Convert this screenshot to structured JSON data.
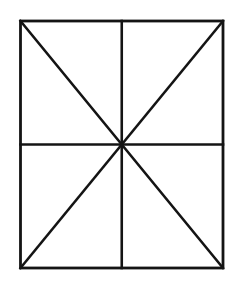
{
  "figure": {
    "title": "Rectangle divided by midlines and diagonals",
    "background_color": "#ffffff",
    "stroke_color": "#141414",
    "stroke_width": 2.6,
    "outer_stroke_width": 2.8,
    "canvas": {
      "width": 241,
      "height": 283
    },
    "rectangle": {
      "name": "outer-rectangle",
      "left": 20.5,
      "top": 21.0,
      "right": 223.0,
      "bottom": 268.0,
      "width": 202.5,
      "height": 247.0
    },
    "center_point": {
      "x": 121.75,
      "y": 144.5
    },
    "segments": [
      {
        "name": "vertical-midline",
        "x1": 121.75,
        "y1": 21.0,
        "x2": 121.75,
        "y2": 268.0
      },
      {
        "name": "horizontal-midline",
        "x1": 20.5,
        "y1": 144.5,
        "x2": 223.0,
        "y2": 144.5
      },
      {
        "name": "diagonal-tl-br",
        "x1": 20.5,
        "y1": 21.0,
        "x2": 223.0,
        "y2": 268.0
      },
      {
        "name": "diagonal-tr-bl",
        "x1": 223.0,
        "y1": 21.0,
        "x2": 20.5,
        "y2": 268.0
      }
    ],
    "regions_count": 8
  }
}
